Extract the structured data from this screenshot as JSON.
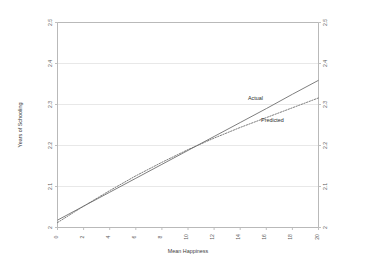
{
  "chart_data": {
    "type": "line",
    "title": "",
    "xlabel": "Mean Happiness",
    "ylabel": "Years of Schooling",
    "xlim": [
      0,
      20
    ],
    "ylim": [
      2.0,
      2.5
    ],
    "grid": "horizontal",
    "legend_position": "inline-annotation",
    "xticks": [
      "0",
      "2",
      "4",
      "6",
      "8",
      "10",
      "12",
      "14",
      "16",
      "18",
      "20"
    ],
    "xtick_values": [
      0,
      2,
      4,
      6,
      8,
      10,
      12,
      14,
      16,
      18,
      20
    ],
    "yticks_left": [
      "2",
      "2.1",
      "2.2",
      "2.3",
      "2.4",
      "2.5"
    ],
    "yticks_right": [
      "2",
      "2.1",
      "2.2",
      "2.3",
      "2.4",
      "2.5"
    ],
    "ytick_values": [
      2.0,
      2.1,
      2.2,
      2.3,
      2.4,
      2.5
    ],
    "series": [
      {
        "name": "Actual",
        "style": "solid",
        "color": "#6f6f6f",
        "x": [
          0,
          2,
          4,
          6,
          8,
          10,
          12,
          14,
          16,
          18,
          20
        ],
        "values": [
          2.018,
          2.052,
          2.086,
          2.12,
          2.154,
          2.188,
          2.222,
          2.256,
          2.29,
          2.325,
          2.359
        ]
      },
      {
        "name": "Predicted",
        "style": "dotted",
        "color": "#6f6f6f",
        "x": [
          0,
          2,
          4,
          6,
          8,
          10,
          12,
          14,
          16,
          18,
          20
        ],
        "values": [
          2.012,
          2.052,
          2.09,
          2.126,
          2.159,
          2.19,
          2.218,
          2.244,
          2.268,
          2.292,
          2.316
        ]
      }
    ],
    "annotations": [
      {
        "text": "Actual",
        "x": 14.6,
        "y": 2.312
      },
      {
        "text": "Predicted",
        "x": 15.6,
        "y": 2.258
      }
    ]
  }
}
